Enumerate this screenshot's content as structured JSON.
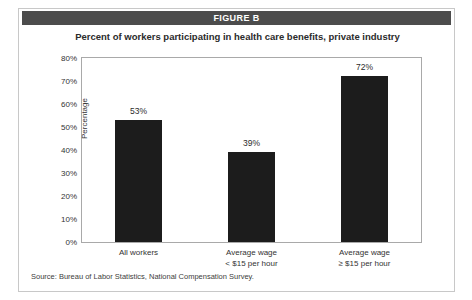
{
  "figure": {
    "header_label": "FIGURE B",
    "source": "Source:  Bureau of Labor Statistics, National Compensation Survey.",
    "header_bg": "#4c4c4c",
    "bar_color": "#1c1c1c",
    "frame_color": "#a9a9a9"
  },
  "chart_data": {
    "type": "bar",
    "title": "Percent of workers participating in health care benefits, private industry",
    "xlabel": "",
    "ylabel": "Percentage",
    "categories": [
      "All workers",
      "Average wage\n< $15 per hour",
      "Average wage\n≥ $15 per hour"
    ],
    "category_lines": [
      [
        "All workers",
        ""
      ],
      [
        "Average wage",
        "< $15 per hour"
      ],
      [
        "Average wage",
        "≥ $15 per hour"
      ]
    ],
    "values": [
      53,
      39,
      72
    ],
    "value_labels": [
      "53%",
      "39%",
      "72%"
    ],
    "ylim": [
      0,
      80
    ],
    "ytick_values": [
      80,
      70,
      60,
      50,
      40,
      30,
      20,
      10,
      0
    ],
    "ytick_labels": [
      "80%",
      "70%",
      "60%",
      "50%",
      "40%",
      "30%",
      "20%",
      "10%",
      "0%"
    ],
    "grid": false,
    "legend": null
  }
}
